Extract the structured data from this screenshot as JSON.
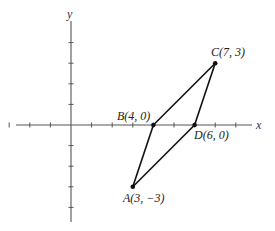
{
  "figure": {
    "axes": {
      "x_label": "x",
      "y_label": "y",
      "origin_px": [
        71,
        125
      ],
      "unit_px": 20.6,
      "x_ticks": [
        -3,
        -2,
        -1,
        1,
        2,
        3,
        4,
        5,
        6,
        7,
        8
      ],
      "y_ticks": [
        -4,
        -3,
        -2,
        -1,
        1,
        2,
        3,
        4
      ]
    },
    "points": [
      {
        "name": "A",
        "coords": "(3, −3)",
        "x": 3,
        "y": -3
      },
      {
        "name": "B",
        "coords": "(4, 0)",
        "x": 4,
        "y": 0
      },
      {
        "name": "C",
        "coords": "(7, 3)",
        "x": 7,
        "y": 3
      },
      {
        "name": "D",
        "coords": "(6, 0)",
        "x": 6,
        "y": 0
      }
    ],
    "labels": {
      "A": "A(3, −3)",
      "B": "B(4, 0)",
      "C": "C(7, 3)",
      "D": "D(6, 0)"
    },
    "polygon": [
      "A",
      "B",
      "C",
      "D"
    ],
    "colors": {
      "line": "#111111",
      "axis": "#555555",
      "background": "#ffffff"
    }
  }
}
